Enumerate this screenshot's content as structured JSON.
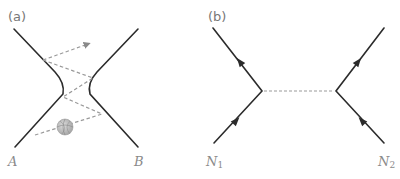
{
  "panel_a": {
    "label": "(a)",
    "endpoint_left": "A",
    "endpoint_right": "B",
    "description": "Two skaters/objects exchanging a ball, depicted as repelling worldlines",
    "ball_icon": "basketball-icon",
    "colors": {
      "line": "#2b2b2b",
      "dashed": "#9a9a9a",
      "ball": "#bdbdbd",
      "label": "#8a8a8a"
    }
  },
  "panel_b": {
    "label": "(b)",
    "endpoint_left": {
      "base": "N",
      "sub": "1"
    },
    "endpoint_right": {
      "base": "N",
      "sub": "2"
    },
    "description": "Feynman diagram of two nucleons exchanging a virtual particle",
    "colors": {
      "line": "#2b2b2b",
      "dashed": "#9a9a9a",
      "label": "#8a8a8a"
    }
  }
}
